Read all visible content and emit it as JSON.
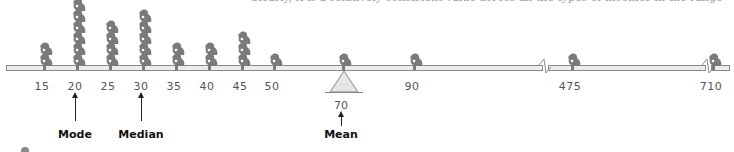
{
  "top_text": "Clearly, it is a relatively consistent value across all the types of incomes in the range",
  "chart_data": {
    "type": "dot-plot (seesaw pictogram)",
    "title": "",
    "xlabel": "",
    "ylabel": "",
    "points": [
      {
        "value": 15,
        "count": 2
      },
      {
        "value": 20,
        "count": 6
      },
      {
        "value": 25,
        "count": 4
      },
      {
        "value": 30,
        "count": 5
      },
      {
        "value": 35,
        "count": 2
      },
      {
        "value": 40,
        "count": 2
      },
      {
        "value": 45,
        "count": 3
      },
      {
        "value": 50,
        "count": 1
      },
      {
        "value": 70,
        "count": 1
      },
      {
        "value": 90,
        "count": 1
      },
      {
        "value": 475,
        "count": 1
      },
      {
        "value": 710,
        "count": 1
      }
    ],
    "annotations": [
      {
        "label": "Mode",
        "value": 20
      },
      {
        "label": "Median",
        "value": 30
      },
      {
        "label": "Mean",
        "value": 70
      }
    ],
    "axis_breaks": [
      "between 90 and 475",
      "between 475 and 710"
    ]
  },
  "ticks": [
    {
      "label": "15",
      "x": 42
    },
    {
      "label": "20",
      "x": 75
    },
    {
      "label": "25",
      "x": 108
    },
    {
      "label": "30",
      "x": 141
    },
    {
      "label": "35",
      "x": 174
    },
    {
      "label": "40",
      "x": 207
    },
    {
      "label": "45",
      "x": 240
    },
    {
      "label": "50",
      "x": 272
    },
    {
      "label": "90",
      "x": 412
    },
    {
      "label": "475",
      "x": 570
    },
    {
      "label": "710",
      "x": 711
    }
  ],
  "mean_value": "70",
  "stats": {
    "mode": "Mode",
    "median": "Median",
    "mean": "Mean"
  },
  "colors": {
    "figure": "#7a7a7a",
    "beam_fill": "#ececec",
    "beam_stroke": "#8a8a8a",
    "fulcrum": "#e6e6e6"
  }
}
